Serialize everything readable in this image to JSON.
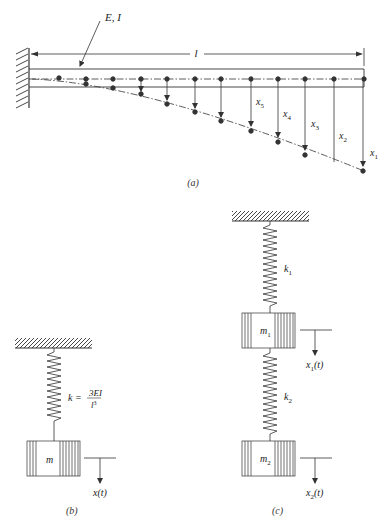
{
  "figure_a": {
    "caption": "(a)",
    "beam_label": "E, I",
    "length_label": "l",
    "displacement_labels": [
      "x5",
      "x4",
      "x3",
      "x2",
      "x1"
    ],
    "displacement_label_parts": [
      {
        "base": "x",
        "sub": "5"
      },
      {
        "base": "x",
        "sub": "4"
      },
      {
        "base": "x",
        "sub": "3"
      },
      {
        "base": "x",
        "sub": "2"
      },
      {
        "base": "x",
        "sub": "1"
      }
    ]
  },
  "figure_b": {
    "caption": "(b)",
    "stiffness_prefix": "k =",
    "stiffness_numerator": "3EI",
    "stiffness_denominator_base": "l",
    "stiffness_denominator_exp": "3",
    "mass_label": "m",
    "displacement_label": "x(t)"
  },
  "figure_c": {
    "caption": "(c)",
    "spring1_label": {
      "base": "k",
      "sub": "1"
    },
    "spring2_label": {
      "base": "k",
      "sub": "2"
    },
    "mass1_label": {
      "base": "m",
      "sub": "1"
    },
    "mass2_label": {
      "base": "m",
      "sub": "2"
    },
    "disp1_label": {
      "base": "x",
      "sub": "1",
      "tail": "(t)"
    },
    "disp2_label": {
      "base": "x",
      "sub": "2",
      "tail": "(t)"
    }
  },
  "colors": {
    "line": "#333333",
    "background": "#ffffff"
  }
}
